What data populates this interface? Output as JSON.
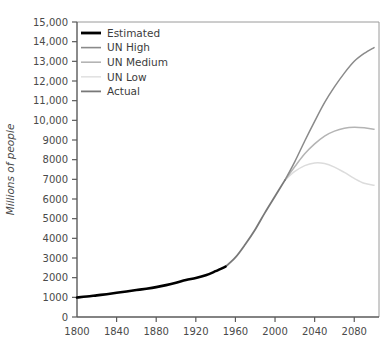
{
  "chart_data": {
    "type": "line",
    "title": "",
    "subtitle": "",
    "xlabel": "",
    "ylabel": "Millions of people",
    "xlim": [
      1800,
      2105
    ],
    "ylim": [
      0,
      15000
    ],
    "grid": false,
    "legend_position": "top-left",
    "xticks": [
      1800,
      1840,
      1880,
      1920,
      1960,
      2000,
      2040,
      2080
    ],
    "xtick_labels": [
      "1800",
      "1840",
      "1880",
      "1920",
      "1960",
      "2000",
      "2040",
      "2080"
    ],
    "yticks": [
      0,
      1000,
      2000,
      3000,
      4000,
      5000,
      6000,
      7000,
      8000,
      9000,
      10000,
      11000,
      12000,
      13000,
      14000,
      15000
    ],
    "ytick_labels": [
      "0",
      "1000",
      "2000",
      "3000",
      "4000",
      "5000",
      "6000",
      "7000",
      "8000",
      "9000",
      "10,000",
      "11,000",
      "12,000",
      "13,000",
      "14,000",
      "15,000"
    ],
    "series": [
      {
        "name": "Estimated",
        "color": "#000000",
        "width": 2.6,
        "x": [
          1800,
          1810,
          1820,
          1830,
          1840,
          1850,
          1860,
          1870,
          1880,
          1890,
          1900,
          1910,
          1920,
          1930,
          1940,
          1950
        ],
        "values": [
          990,
          1040,
          1100,
          1160,
          1230,
          1300,
          1370,
          1440,
          1520,
          1620,
          1740,
          1880,
          1980,
          2120,
          2330,
          2560
        ]
      },
      {
        "name": "UN High",
        "color": "#8a8a8a",
        "width": 1.5,
        "x": [
          2010,
          2020,
          2030,
          2040,
          2050,
          2060,
          2070,
          2080,
          2090,
          2100
        ],
        "values": [
          6960,
          7900,
          8950,
          9950,
          10900,
          11700,
          12400,
          13000,
          13400,
          13700
        ]
      },
      {
        "name": "UN Medium",
        "color": "#b4b4b4",
        "width": 1.5,
        "x": [
          2010,
          2020,
          2030,
          2040,
          2050,
          2060,
          2070,
          2080,
          2090,
          2100
        ],
        "values": [
          6960,
          7650,
          8300,
          8800,
          9200,
          9450,
          9600,
          9650,
          9620,
          9550
        ]
      },
      {
        "name": "UN Low",
        "color": "#dcdcdc",
        "width": 1.5,
        "x": [
          2010,
          2020,
          2030,
          2040,
          2050,
          2060,
          2070,
          2080,
          2090,
          2100
        ],
        "values": [
          6960,
          7400,
          7700,
          7830,
          7800,
          7620,
          7350,
          7050,
          6800,
          6700
        ]
      },
      {
        "name": "Actual",
        "color": "#787878",
        "width": 1.8,
        "x": [
          1950,
          1960,
          1970,
          1980,
          1990,
          2000,
          2010
        ],
        "values": [
          2560,
          3030,
          3700,
          4450,
          5320,
          6140,
          6960
        ]
      }
    ]
  },
  "legend": {
    "items": [
      {
        "label": "Estimated",
        "color": "#000000",
        "width": 2.8
      },
      {
        "label": "UN High",
        "color": "#8a8a8a",
        "width": 1.6
      },
      {
        "label": "UN Medium",
        "color": "#b4b4b4",
        "width": 1.6
      },
      {
        "label": "UN Low",
        "color": "#e2e2e2",
        "width": 1.6
      },
      {
        "label": "Actual",
        "color": "#787878",
        "width": 1.8
      }
    ]
  },
  "axes": {
    "y_axis_title": "Millions of people"
  }
}
